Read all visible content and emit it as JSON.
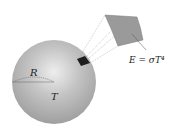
{
  "diagram": {
    "sphere": {
      "radius_label": "R",
      "temperature_label": "T",
      "color": "#b8b8b8"
    },
    "patch": {
      "color": "#9a9a9a",
      "dark_patch_color": "#1e1e1e"
    },
    "equation": "E = σT⁴"
  }
}
